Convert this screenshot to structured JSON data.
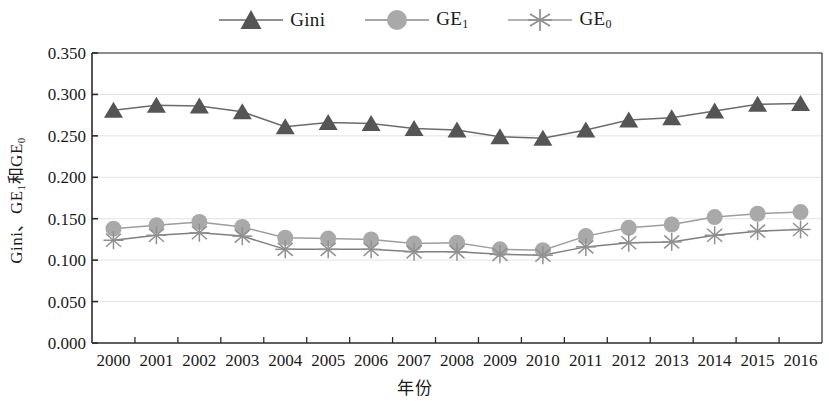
{
  "chart_data": {
    "type": "line",
    "title": "",
    "xlabel": "年份",
    "ylabel": "Gini、GE₁和GE₀",
    "ylabel_parts": {
      "prefix": "Gini、GE",
      "sub1": "1",
      "mid": "和GE",
      "sub2": "0"
    },
    "x": [
      2000,
      2001,
      2002,
      2003,
      2004,
      2005,
      2006,
      2007,
      2008,
      2009,
      2010,
      2011,
      2012,
      2013,
      2014,
      2015,
      2016
    ],
    "categories": [
      "2000",
      "2001",
      "2002",
      "2003",
      "2004",
      "2005",
      "2006",
      "2007",
      "2008",
      "2009",
      "2010",
      "2011",
      "2012",
      "2013",
      "2014",
      "2015",
      "2016"
    ],
    "series": [
      {
        "name": "Gini",
        "marker": "triangle",
        "color": "#555555",
        "values": [
          0.281,
          0.287,
          0.286,
          0.279,
          0.261,
          0.266,
          0.265,
          0.259,
          0.257,
          0.249,
          0.247,
          0.257,
          0.269,
          0.272,
          0.28,
          0.288,
          0.289
        ]
      },
      {
        "name": "GE_1",
        "label_prefix": "GE",
        "label_sub": "1",
        "marker": "circle",
        "color": "#a9a9a9",
        "values": [
          0.138,
          0.142,
          0.146,
          0.14,
          0.127,
          0.126,
          0.125,
          0.12,
          0.121,
          0.113,
          0.112,
          0.129,
          0.139,
          0.143,
          0.152,
          0.156,
          0.158
        ]
      },
      {
        "name": "GE_0",
        "label_prefix": "GE",
        "label_sub": "0",
        "marker": "asterisk",
        "color": "#909090",
        "values": [
          0.124,
          0.13,
          0.133,
          0.129,
          0.113,
          0.113,
          0.113,
          0.11,
          0.11,
          0.107,
          0.106,
          0.116,
          0.121,
          0.122,
          0.13,
          0.135,
          0.137
        ]
      }
    ],
    "ylim": [
      0.0,
      0.35
    ],
    "ytick_values": [
      0.0,
      0.05,
      0.1,
      0.15,
      0.2,
      0.25,
      0.3,
      0.35
    ],
    "ytick_labels": [
      "0.000",
      "0.050",
      "0.100",
      "0.150",
      "0.200",
      "0.250",
      "0.300",
      "0.350"
    ],
    "grid": true,
    "grid_axis": "y",
    "legend_position": "top-center"
  },
  "legend": {
    "items": [
      {
        "name": "Gini",
        "sub": "",
        "marker": "triangle",
        "color": "#555555"
      },
      {
        "name": "GE",
        "sub": "1",
        "marker": "circle",
        "color": "#a9a9a9"
      },
      {
        "name": "GE",
        "sub": "0",
        "marker": "asterisk",
        "color": "#909090"
      }
    ]
  }
}
